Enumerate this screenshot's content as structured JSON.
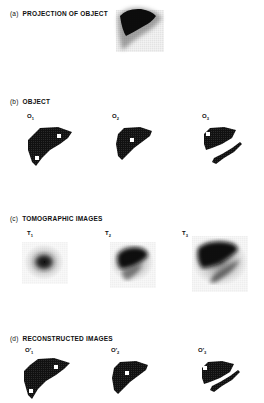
{
  "figure": {
    "panels": [
      {
        "id": "a",
        "letter": "(a)",
        "title": "PROJECTION OF OBJECT",
        "images": [
          {
            "label": "",
            "kind": "projection"
          }
        ]
      },
      {
        "id": "b",
        "letter": "(b)",
        "title": "OBJECT",
        "images": [
          {
            "label": "O",
            "subscript": "1",
            "kind": "object-two-spots"
          },
          {
            "label": "O",
            "subscript": "2",
            "kind": "object-one-spot"
          },
          {
            "label": "O",
            "subscript": "3",
            "kind": "object-slice-with-spleen"
          }
        ]
      },
      {
        "id": "c",
        "letter": "(c)",
        "title": "TOMOGRAPHIC IMAGES",
        "images": [
          {
            "label": "T",
            "subscript": "1",
            "kind": "blurred-small"
          },
          {
            "label": "T",
            "subscript": "2",
            "kind": "blurred-medium"
          },
          {
            "label": "T",
            "subscript": "3",
            "kind": "blurred-large"
          }
        ]
      },
      {
        "id": "d",
        "letter": "(d)",
        "title": "RECONSTRUCTED IMAGES",
        "images": [
          {
            "label": "O'",
            "subscript": "1",
            "kind": "reconstructed-two-spots"
          },
          {
            "label": "O'",
            "subscript": "2",
            "kind": "reconstructed-one-spot"
          },
          {
            "label": "O'",
            "subscript": "3",
            "kind": "reconstructed-slice-with-spleen"
          }
        ]
      }
    ],
    "colors": {
      "ink": "#111111",
      "background": "#ffffff"
    }
  }
}
